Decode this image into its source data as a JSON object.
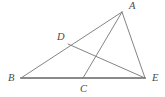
{
  "figure": {
    "background_color": "#ffffff",
    "width": 165,
    "height": 97,
    "stroke_color_base": "#8a8a8a",
    "stroke_color_lines": "#7d7d7d",
    "label_color": "#4a4a4a"
  },
  "points": [
    {
      "id": "A",
      "label": "A",
      "x": 122,
      "y": 12,
      "label_x": 129,
      "label_y": 9
    },
    {
      "id": "B",
      "label": "B",
      "x": 21,
      "y": 78,
      "label_x": 8,
      "label_y": 81
    },
    {
      "id": "C",
      "label": "C",
      "x": 83,
      "y": 78,
      "label_x": 80,
      "label_y": 92
    },
    {
      "id": "D",
      "label": "D",
      "x": 68,
      "y": 44,
      "label_x": 57,
      "label_y": 40
    },
    {
      "id": "E",
      "label": "E",
      "x": 145,
      "y": 78,
      "label_x": 152,
      "label_y": 81
    }
  ],
  "segments": [
    {
      "id": "BE",
      "from": "B",
      "to": "E",
      "style": "thick",
      "name": "base-segment-be"
    },
    {
      "id": "BA",
      "from": "B",
      "to": "A",
      "style": "thin",
      "name": "segment-ba"
    },
    {
      "id": "AE",
      "from": "A",
      "to": "E",
      "style": "thin",
      "name": "segment-ae"
    },
    {
      "id": "DE",
      "from": "D",
      "to": "E",
      "style": "thin",
      "name": "segment-de"
    },
    {
      "id": "CA",
      "from": "C",
      "to": "A",
      "style": "thin",
      "name": "segment-ca"
    }
  ]
}
